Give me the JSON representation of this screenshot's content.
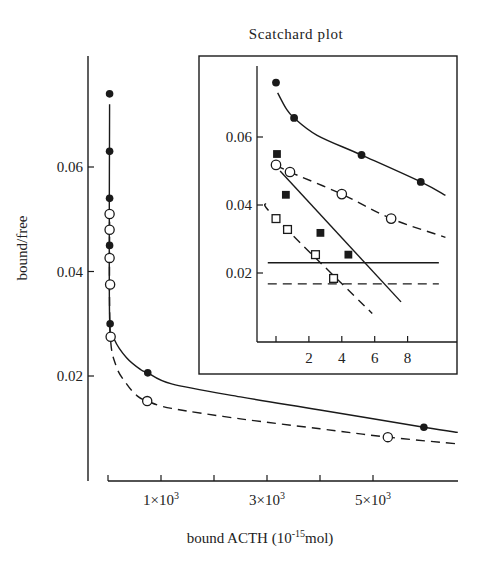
{
  "chart_data": [
    {
      "id": "main",
      "type": "scatter",
      "title": "",
      "xlabel": "bound ACTH (10^-15 mol)",
      "xlabel_parts": {
        "prefix": "bound ACTH (10",
        "sup": "-15",
        "suffix": "mol)"
      },
      "ylabel": "bound/free",
      "xlim": [
        0,
        6.6
      ],
      "x_unit_multiplier": 1000,
      "ylim": [
        0.0,
        0.078
      ],
      "x_ticks": [
        0,
        1,
        2,
        3,
        4,
        5
      ],
      "x_tick_labels": [
        {
          "at": 1,
          "base": "1×10",
          "exp": "3"
        },
        {
          "at": 3,
          "base": "3×10",
          "exp": "3"
        },
        {
          "at": 5,
          "base": "5×10",
          "exp": "3"
        }
      ],
      "y_ticks": [
        0.02,
        0.04,
        0.06
      ],
      "y_tick_labels": [
        "0.02",
        "0.04",
        "0.06"
      ],
      "grid": false,
      "series": [
        {
          "name": "filled circles",
          "marker": "filled-circle",
          "line": "solid",
          "points": [
            [
              0.03,
              0.074
            ],
            [
              0.03,
              0.063
            ],
            [
              0.03,
              0.054
            ],
            [
              0.03,
              0.045
            ],
            [
              0.04,
              0.03
            ],
            [
              0.75,
              0.0206
            ],
            [
              5.96,
              0.0102
            ]
          ],
          "curve": [
            [
              0.03,
              0.072
            ],
            [
              0.03,
              0.031
            ],
            [
              0.12,
              0.027
            ],
            [
              0.35,
              0.0235
            ],
            [
              0.62,
              0.0212
            ],
            [
              0.75,
              0.0206
            ],
            [
              1.2,
              0.0185
            ],
            [
              2.5,
              0.016
            ],
            [
              4.0,
              0.0135
            ],
            [
              5.96,
              0.0102
            ],
            [
              6.6,
              0.0092
            ]
          ]
        },
        {
          "name": "open circles",
          "marker": "open-circle",
          "line": "dashed",
          "points": [
            [
              0.03,
              0.051
            ],
            [
              0.03,
              0.048
            ],
            [
              0.03,
              0.0426
            ],
            [
              0.04,
              0.0375
            ],
            [
              0.05,
              0.0275
            ],
            [
              0.74,
              0.0152
            ],
            [
              5.28,
              0.0083
            ]
          ],
          "curve": [
            [
              0.03,
              0.0495
            ],
            [
              0.04,
              0.0285
            ],
            [
              0.15,
              0.022
            ],
            [
              0.35,
              0.0185
            ],
            [
              0.55,
              0.0162
            ],
            [
              0.74,
              0.0152
            ],
            [
              1.2,
              0.0138
            ],
            [
              2.5,
              0.0118
            ],
            [
              4.0,
              0.0099
            ],
            [
              5.28,
              0.0083
            ],
            [
              6.6,
              0.007
            ]
          ]
        }
      ]
    },
    {
      "id": "inset",
      "type": "scatter",
      "title": "Scatchard plot",
      "xlabel": "",
      "ylabel": "",
      "xlim": [
        -1.1,
        10.5
      ],
      "ylim": [
        0.0,
        0.08
      ],
      "x_ticks": [
        0,
        2,
        4,
        6,
        8
      ],
      "x_tick_labels": [
        "",
        "2",
        "4",
        "6",
        "8"
      ],
      "y_ticks": [
        0.02,
        0.04,
        0.06
      ],
      "y_tick_labels": [
        "0.02",
        "0.04",
        "0.06"
      ],
      "grid": false,
      "series": [
        {
          "name": "filled circles",
          "marker": "filled-circle",
          "line": "solid",
          "points": [
            [
              0.0,
              0.076
            ],
            [
              1.1,
              0.0656
            ],
            [
              5.2,
              0.0547
            ],
            [
              8.8,
              0.0468
            ]
          ],
          "curve": [
            [
              0.1,
              0.073
            ],
            [
              0.6,
              0.0685
            ],
            [
              1.1,
              0.0656
            ],
            [
              2.5,
              0.0605
            ],
            [
              5.2,
              0.0547
            ],
            [
              8.8,
              0.0468
            ],
            [
              10.3,
              0.0428
            ]
          ]
        },
        {
          "name": "open circles",
          "marker": "open-circle",
          "line": "dashed",
          "points": [
            [
              0.0,
              0.0518
            ],
            [
              0.85,
              0.0497
            ],
            [
              4.0,
              0.0432
            ],
            [
              7.0,
              0.036
            ]
          ],
          "curve": [
            [
              0.0,
              0.0518
            ],
            [
              0.85,
              0.0497
            ],
            [
              4.0,
              0.0432
            ],
            [
              7.0,
              0.036
            ],
            [
              10.3,
              0.0305
            ]
          ]
        },
        {
          "name": "filled squares",
          "marker": "filled-square",
          "line": "solid",
          "points": [
            [
              0.06,
              0.055
            ],
            [
              0.6,
              0.043
            ],
            [
              2.7,
              0.0318
            ],
            [
              4.4,
              0.0254
            ]
          ],
          "curve": [
            [
              0.25,
              0.05
            ],
            [
              7.6,
              0.0115
            ]
          ]
        },
        {
          "name": "open squares",
          "marker": "open-square",
          "line": "dashed",
          "points": [
            [
              0.0,
              0.036
            ],
            [
              0.7,
              0.0328
            ],
            [
              2.4,
              0.0254
            ],
            [
              3.5,
              0.0184
            ]
          ],
          "curve": [
            [
              -0.65,
              0.0405
            ],
            [
              0.0,
              0.036
            ],
            [
              5.85,
              0.0081
            ]
          ]
        },
        {
          "name": "horizontal reference (solid)",
          "marker": "none",
          "line": "solid",
          "points": [],
          "curve": [
            [
              -0.5,
              0.023
            ],
            [
              9.9,
              0.023
            ]
          ]
        },
        {
          "name": "horizontal reference (dashed)",
          "marker": "none",
          "line": "dashed",
          "points": [],
          "curve": [
            [
              -0.5,
              0.0168
            ],
            [
              9.9,
              0.0168
            ]
          ]
        }
      ]
    }
  ],
  "colors": {
    "ink": "#1a1a1a",
    "background": "#ffffff"
  }
}
